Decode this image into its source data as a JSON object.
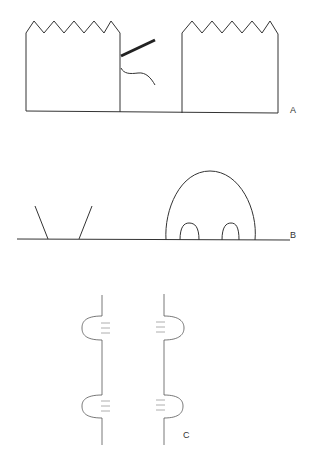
{
  "figure": {
    "panels": [
      {
        "id": "A",
        "label": "A",
        "description": "Two box-like structures with zigzag tops on a baseline, with a thick bar and a wavy line extending from the right edge of the left box"
      },
      {
        "id": "B",
        "label": "B",
        "description": "A V-shaped pair of lines on a baseline and a large dome containing two small arches"
      },
      {
        "id": "C",
        "label": "C",
        "description": "Two vertical lines each with two rounded bulges containing short horizontal striations"
      }
    ],
    "colors": {
      "line": "#333333",
      "background": "#ffffff"
    }
  }
}
